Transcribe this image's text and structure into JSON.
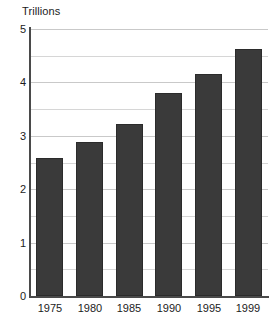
{
  "chart_data": {
    "type": "bar",
    "title": "Trillions",
    "xlabel": "",
    "ylabel": "",
    "categories": [
      "1975",
      "1980",
      "1985",
      "1990",
      "1995",
      "1999"
    ],
    "values": [
      2.58,
      2.88,
      3.22,
      3.8,
      4.15,
      4.62
    ],
    "series": [
      {
        "name": "Trillions",
        "values": [
          2.58,
          2.88,
          3.22,
          3.8,
          4.15,
          4.62
        ]
      }
    ],
    "ylim": [
      0,
      5
    ],
    "xlim_categories": 6,
    "y_major_ticks": [
      "0",
      "1",
      "2",
      "3",
      "4",
      "5"
    ],
    "y_major_tick_values": [
      0,
      1,
      2,
      3,
      4,
      5
    ],
    "y_minor_tick_values": [
      0.5,
      1.5,
      2.5,
      3.5,
      4.5
    ],
    "grid": "horizontal",
    "legend": "none",
    "bar_color": "#3a3a3a",
    "gridline_color": "#c9c9c9",
    "axis_color": "#4a4a4a",
    "background_color": "#ffffff",
    "text_color": "#1c1c1c"
  }
}
